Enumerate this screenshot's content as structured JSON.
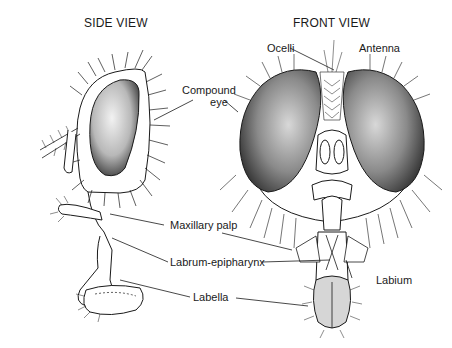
{
  "diagram": {
    "views": [
      {
        "id": "side",
        "title": "SIDE VIEW"
      },
      {
        "id": "front",
        "title": "FRONT VIEW"
      }
    ],
    "labels": {
      "compound_eye_line1": "Compound",
      "compound_eye_line2": "eye",
      "ocelli": "Ocelli",
      "antenna": "Antenna",
      "maxillary_palp": "Maxillary palp",
      "labrum_epipharynx": "Labrum-epipharynx",
      "labium": "Labium",
      "labella": "Labella"
    },
    "colors": {
      "ink": "#1a1a1a",
      "eye_dark": "#3a3a3a",
      "eye_light": "#cfcfcf",
      "background": "#ffffff"
    }
  }
}
